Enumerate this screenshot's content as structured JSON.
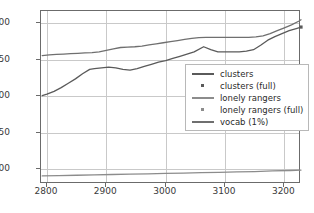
{
  "chart_data": {
    "type": "line",
    "title": "",
    "xlabel": "",
    "ylabel": "",
    "xlim": [
      2790,
      3228
    ],
    "ylim": [
      80,
      317
    ],
    "xticks": [
      2800,
      2900,
      3000,
      3100,
      3200
    ],
    "yticks": [
      100,
      150,
      200,
      250,
      300
    ],
    "grid": true,
    "legend_position": "center-right",
    "series": [
      {
        "name": "clusters",
        "kind": "line",
        "color": "#5a5a5a",
        "x": [
          2792,
          2800,
          2812,
          2824,
          2836,
          2848,
          2860,
          2872,
          2880,
          2892,
          2904,
          2916,
          2928,
          2940,
          2952,
          2964,
          2976,
          2988,
          3000,
          3012,
          3024,
          3036,
          3048,
          3064,
          3076,
          3088,
          3100,
          3112,
          3124,
          3136,
          3148,
          3160,
          3172,
          3184,
          3196,
          3208,
          3220,
          3228
        ],
        "y": [
          201,
          203,
          207,
          212,
          218,
          224,
          231,
          237,
          238,
          239,
          240,
          239,
          237,
          236,
          238,
          241,
          244,
          247,
          249,
          252,
          255,
          258,
          261,
          268,
          264,
          261,
          261,
          261,
          261,
          262,
          264,
          270,
          277,
          282,
          286,
          290,
          293,
          295
        ]
      },
      {
        "name": "clusters (full)",
        "kind": "scatter",
        "color": "#5a5a5a",
        "marker": "square",
        "x": [
          3228
        ],
        "y": [
          295
        ]
      },
      {
        "name": "lonely rangers",
        "kind": "line",
        "color": "#8c8c8c",
        "x": [
          2792,
          2820,
          2850,
          2880,
          2910,
          2940,
          2970,
          3000,
          3030,
          3060,
          3090,
          3120,
          3150,
          3180,
          3210,
          3228
        ],
        "y": [
          91,
          91.5,
          92,
          92.5,
          93,
          93.5,
          94,
          94.5,
          95,
          95.5,
          96,
          96.5,
          97,
          98,
          98.5,
          99
        ]
      },
      {
        "name": "lonely rangers (full)",
        "kind": "scatter",
        "color": "#8c8c8c",
        "marker": "square",
        "x": [
          3228
        ],
        "y": [
          240
        ]
      },
      {
        "name": "vocab (1%)",
        "kind": "line",
        "color": "#6f6f6f",
        "x": [
          2792,
          2804,
          2816,
          2828,
          2840,
          2852,
          2864,
          2876,
          2888,
          2900,
          2912,
          2924,
          2936,
          2948,
          2960,
          2972,
          2984,
          2996,
          3008,
          3020,
          3032,
          3044,
          3056,
          3068,
          3080,
          3092,
          3104,
          3116,
          3128,
          3140,
          3152,
          3164,
          3176,
          3188,
          3200,
          3212,
          3224,
          3228
        ],
        "y": [
          256,
          257,
          257.5,
          258,
          258.5,
          259,
          259.5,
          260,
          261,
          263,
          265,
          267,
          267.5,
          268,
          269,
          270.5,
          272,
          273.5,
          275,
          276.5,
          278,
          279.5,
          280.5,
          281,
          281,
          281,
          281,
          281,
          281,
          281,
          281.5,
          283,
          286,
          290,
          294,
          298,
          303,
          305
        ]
      }
    ],
    "legend_entries": [
      {
        "label": "clusters",
        "marker_type": "line",
        "color": "#5a5a5a"
      },
      {
        "label": "clusters (full)",
        "marker_type": "square",
        "color": "#5a5a5a"
      },
      {
        "label": "lonely rangers",
        "marker_type": "line",
        "color": "#8c8c8c"
      },
      {
        "label": "lonely rangers (full)",
        "marker_type": "square",
        "color": "#8c8c8c"
      },
      {
        "label": "vocab (1%)",
        "marker_type": "line",
        "color": "#6f6f6f"
      }
    ]
  }
}
